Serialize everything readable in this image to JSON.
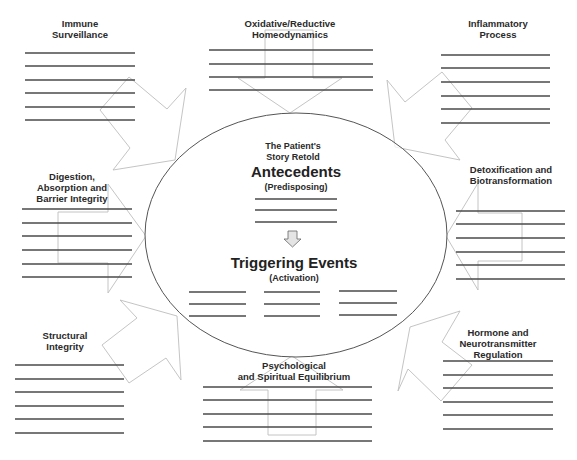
{
  "diagram": {
    "center": {
      "heading_line1": "The Patient's",
      "heading_line2": "Story Retold",
      "antecedents_label": "Antecedents",
      "antecedents_sub": "(Predisposing)",
      "antecedents_blank_lines": 3,
      "arrow": "down-arrow-icon",
      "triggering_label": "Triggering Events",
      "triggering_sub": "(Activation)",
      "triggering_columns": 3,
      "triggering_blank_lines_per_column": 3
    },
    "nodes": [
      {
        "id": "immune",
        "title": "Immune\nSurveillance",
        "blank_lines": 6
      },
      {
        "id": "oxidative",
        "title": "Oxidative/Reductive\nHomeodynamics",
        "blank_lines": 4
      },
      {
        "id": "inflammatory",
        "title": "Inflammatory\nProcess",
        "blank_lines": 6
      },
      {
        "id": "digestion",
        "title": "Digestion,\nAbsorption and\nBarrier Integrity",
        "blank_lines": 6
      },
      {
        "id": "detox",
        "title": "Detoxification and\nBiotransformation",
        "blank_lines": 6
      },
      {
        "id": "structural",
        "title": "Structural\nIntegrity",
        "blank_lines": 6
      },
      {
        "id": "psychological",
        "title": "Psychological\nand Spiritual Equilibrium",
        "blank_lines": 5
      },
      {
        "id": "hormone",
        "title": "Hormone and\nNeurotransmitter Regulation",
        "blank_lines": 6
      }
    ],
    "colors": {
      "line": "#4a4a4a",
      "ellipse": "#555555",
      "arrow_outline": "#bdbdbd",
      "text": "#2a2a2a"
    }
  }
}
